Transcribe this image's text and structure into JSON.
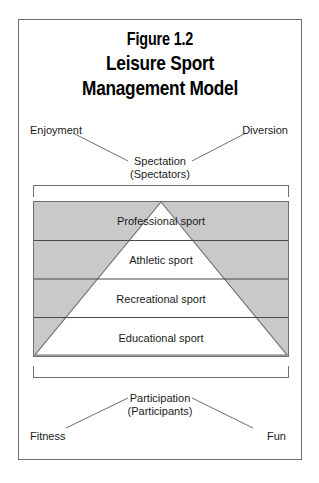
{
  "figure": {
    "number": "Figure 1.2",
    "title_line1": "Leisure Sport",
    "title_line2": "Management Model"
  },
  "top_section": {
    "left_label": "Enjoyment",
    "right_label": "Diversion",
    "center_label_line1": "Spectation",
    "center_label_line2": "(Spectators)"
  },
  "bottom_section": {
    "left_label": "Fitness",
    "right_label": "Fun",
    "center_label_line1": "Participation",
    "center_label_line2": "(Participants)"
  },
  "pyramid": {
    "tiers": [
      {
        "label": "Professional sport"
      },
      {
        "label": "Athletic sport"
      },
      {
        "label": "Recreational sport"
      },
      {
        "label": "Educational sport"
      }
    ]
  },
  "colors": {
    "shaded_fill": "#c9c9c9",
    "triangle_fill": "#ffffff",
    "line": "#6f6f6f",
    "divider": "#4a4a4a",
    "text": "#1a1a1a"
  }
}
